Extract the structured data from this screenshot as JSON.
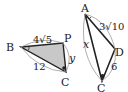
{
  "figure_left": {
    "vertices": {
      "B": "B",
      "P": "P",
      "C": "C"
    },
    "labels": {
      "BP": "4√5",
      "BC": "12",
      "PC": "y"
    },
    "fill_color": "#c8c8c8",
    "right_angle_at": "C",
    "angle_mark_at": "B"
  },
  "figure_right": {
    "vertices": {
      "A": "A",
      "D": "D",
      "C": "C"
    },
    "labels": {
      "AD": "3√10",
      "AC": "x",
      "DC": "6"
    },
    "right_angle_at": "C",
    "angle_mark_at": "A"
  },
  "colors": {
    "stroke": "#222222",
    "fill": "#c8c8c8",
    "arc": "#999999"
  }
}
